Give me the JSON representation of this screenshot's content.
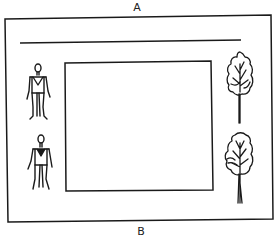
{
  "diagram": {
    "labels": {
      "top": "A",
      "bottom": "B"
    },
    "elements": {
      "outer_frame": "room-boundary",
      "top_line": "wall-line",
      "center_rect": "central-area",
      "people": [
        "person",
        "person"
      ],
      "trees": [
        "tree",
        "tree"
      ]
    },
    "colors": {
      "stroke": "#1a1a1a",
      "background": "#ffffff"
    }
  }
}
